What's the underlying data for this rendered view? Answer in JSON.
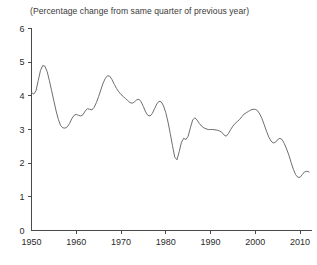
{
  "chart_title": "(Percentage change from same quarter of previous year)",
  "axes": {
    "y_ticks": [
      "0",
      "1",
      "2",
      "3",
      "4",
      "5",
      "6"
    ],
    "x_ticks": [
      "1950",
      "1960",
      "1970",
      "1980",
      "1990",
      "2000",
      "2010"
    ]
  },
  "colors": {
    "background": "#ffffff",
    "line": "#6e6e6e",
    "axis": "#4a4a4a",
    "text": "#2b2b2b",
    "title_text": "#3a3a3a"
  },
  "chart_data": {
    "type": "line",
    "title": "(Percentage change from same quarter of previous year)",
    "subtitle": "",
    "xlabel": "",
    "ylabel": "",
    "xlim": [
      1950,
      2012
    ],
    "ylim": [
      0,
      6
    ],
    "grid": false,
    "legend": "none",
    "x_tick_values": [
      1950,
      1960,
      1970,
      1980,
      1990,
      2000,
      2010
    ],
    "y_tick_values": [
      0,
      1,
      2,
      3,
      4,
      5,
      6
    ],
    "series": [
      {
        "name": "Percentage change from same quarter of previous year",
        "x": [
          1950,
          1950.5,
          1951,
          1951.5,
          1952,
          1952.5,
          1953,
          1953.5,
          1954,
          1954.5,
          1955,
          1955.5,
          1956,
          1956.5,
          1957,
          1957.5,
          1958,
          1958.5,
          1959,
          1959.5,
          1960,
          1960.5,
          1961,
          1961.5,
          1962,
          1962.5,
          1963,
          1963.5,
          1964,
          1964.5,
          1965,
          1965.5,
          1966,
          1966.5,
          1967,
          1967.5,
          1968,
          1968.5,
          1969,
          1969.5,
          1970,
          1970.5,
          1971,
          1971.5,
          1972,
          1972.5,
          1973,
          1973.5,
          1974,
          1974.5,
          1975,
          1975.5,
          1976,
          1976.5,
          1977,
          1977.5,
          1978,
          1978.5,
          1979,
          1979.5,
          1980,
          1980.5,
          1981,
          1981.5,
          1982,
          1982.5,
          1983,
          1983.5,
          1984,
          1984.5,
          1985,
          1985.5,
          1986,
          1986.5,
          1987,
          1987.5,
          1988,
          1988.5,
          1989,
          1989.5,
          1990,
          1990.5,
          1991,
          1991.5,
          1992,
          1992.5,
          1993,
          1993.5,
          1994,
          1994.5,
          1995,
          1995.5,
          1996,
          1996.5,
          1997,
          1997.5,
          1998,
          1998.5,
          1999,
          1999.5,
          2000,
          2000.5,
          2001,
          2001.5,
          2002,
          2002.5,
          2003,
          2003.5,
          2004,
          2004.5,
          2005,
          2005.5,
          2006,
          2006.5,
          2007,
          2007.5,
          2008,
          2008.5,
          2009,
          2009.5,
          2010,
          2010.5,
          2011,
          2011.5,
          2012
        ],
        "y": [
          4.1,
          4.05,
          4.15,
          4.45,
          4.75,
          4.9,
          4.88,
          4.72,
          4.45,
          4.15,
          3.85,
          3.55,
          3.3,
          3.12,
          3.05,
          3.04,
          3.08,
          3.18,
          3.32,
          3.42,
          3.45,
          3.42,
          3.4,
          3.44,
          3.55,
          3.62,
          3.6,
          3.58,
          3.66,
          3.8,
          3.98,
          4.18,
          4.38,
          4.52,
          4.6,
          4.58,
          4.48,
          4.34,
          4.22,
          4.12,
          4.04,
          3.98,
          3.92,
          3.86,
          3.8,
          3.78,
          3.82,
          3.88,
          3.9,
          3.82,
          3.68,
          3.52,
          3.42,
          3.4,
          3.48,
          3.62,
          3.76,
          3.84,
          3.82,
          3.7,
          3.5,
          3.22,
          2.88,
          2.52,
          2.18,
          2.1,
          2.34,
          2.62,
          2.74,
          2.7,
          2.8,
          3.05,
          3.28,
          3.35,
          3.28,
          3.18,
          3.1,
          3.05,
          3.02,
          3.0,
          3.0,
          3.0,
          2.99,
          2.98,
          2.96,
          2.92,
          2.84,
          2.8,
          2.88,
          3.0,
          3.1,
          3.18,
          3.24,
          3.3,
          3.38,
          3.46,
          3.5,
          3.54,
          3.58,
          3.6,
          3.6,
          3.56,
          3.46,
          3.32,
          3.14,
          2.95,
          2.78,
          2.66,
          2.6,
          2.62,
          2.7,
          2.74,
          2.7,
          2.58,
          2.42,
          2.24,
          2.02,
          1.82,
          1.66,
          1.58,
          1.58,
          1.66,
          1.74,
          1.76,
          1.74
        ]
      }
    ]
  }
}
